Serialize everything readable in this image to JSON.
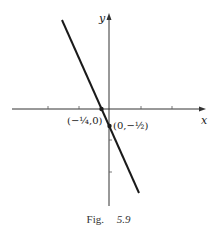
{
  "figure": {
    "caption_prefix": "Fig.",
    "caption_number": "5.9",
    "axes": {
      "x_label": "x",
      "y_label": "y",
      "x_ticks_px": [
        48,
        79,
        141,
        172
      ],
      "y_ticks_px": [
        140,
        172
      ]
    },
    "line": {
      "description": "y = -2x - 1/2",
      "color": "#1a1a1a"
    },
    "points": [
      {
        "label": "(−¼,0)",
        "x": -0.25,
        "y": 0
      },
      {
        "label": "(0,−½)",
        "x": 0,
        "y": -0.5
      }
    ]
  }
}
